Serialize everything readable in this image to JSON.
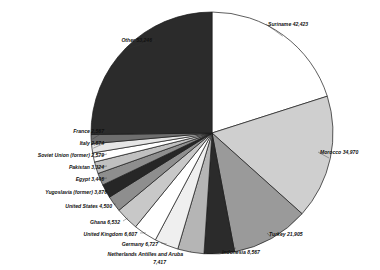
{
  "chart_data": {
    "type": "pie",
    "title": "",
    "subtitle": "",
    "xlabel": "",
    "ylabel": "",
    "legend_position": "none",
    "grid": false,
    "labels_show_value": true,
    "start_angle_deg": 0,
    "direction": "clockwise",
    "categories": [
      "Suriname",
      "Morocco",
      "Turkey",
      "Indonesia",
      "Netherlands Antilles and Aruba",
      "Germany",
      "United Kingdom",
      "Ghana",
      "United States",
      "Yugoslavia (former)",
      "Egypt",
      "Pakistan",
      "Soviet Union (former)",
      "Italy",
      "France",
      "Other"
    ],
    "values": [
      42423,
      34970,
      21905,
      8567,
      7417,
      6727,
      6607,
      6532,
      4500,
      3876,
      3446,
      3324,
      2579,
      2574,
      2567,
      53246
    ],
    "value_labels": [
      "42,423",
      "34,970",
      "21,905",
      "8,567",
      "7,417",
      "6,727",
      "6,607",
      "6,532",
      "4,500",
      "3,876",
      "3,446",
      "3,324",
      "2,579",
      "2,574",
      "2,567",
      "53,246"
    ],
    "slice_colors": [
      "#ffffff",
      "#cfcfcf",
      "#9a9a9a",
      "#2b2b2b",
      "#b5b5b5",
      "#efefef",
      "#ffffff",
      "#c8c8c8",
      "#8e8e8e",
      "#262626",
      "#8e8e8e",
      "#c0c0c0",
      "#ffffff",
      "#e6e6e6",
      "#6e6e6e",
      "#2b2b2b"
    ],
    "slice_stroke": "#1a1a1a",
    "annotations": [
      "Suriname 42,423",
      "Morocco 34,970",
      "Turkey 21,905",
      "Indonesia 8,567",
      "Netherlands Antilles and Aruba 7,417",
      "Germany 6,727",
      "United Kingdom 6,607",
      "Ghana 6,532",
      "United States 4,500",
      "Yugoslavia (former) 3,876",
      "Egypt 3,446",
      "Pakistan 3,324",
      "Soviet Union (former) 2,579",
      "Italy 2,574",
      "France 2,567",
      "Other 53,246"
    ]
  },
  "labels": {
    "suriname": "Suriname 42,423",
    "morocco": "Morocco 34,970",
    "turkey": "Turkey 21,905",
    "indonesia": "Indonesia 8,567",
    "netherlands_antilles_line1": "Netherlands Antilles and Aruba",
    "netherlands_antilles_line2": "7,417",
    "germany": "Germany 6,727",
    "united_kingdom": "United Kingdom 6,607",
    "ghana": "Ghana 6,532",
    "united_states": "United States 4,500",
    "yugoslavia": "Yugoslavia (former) 3,876",
    "egypt": "Egypt 3,446",
    "pakistan": "Pakistan 3,324",
    "soviet_union": "Soviet Union (former) 2,579",
    "italy": "Italy 2,574",
    "france": "France 2,567",
    "other": "Other 53,246"
  }
}
